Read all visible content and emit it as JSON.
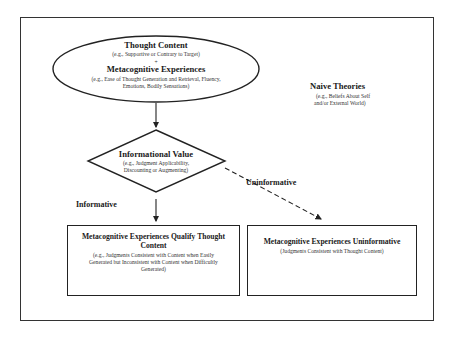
{
  "diagram": {
    "colors": {
      "stroke": "#222222",
      "background": "#ffffff",
      "text": "#1a1a1a"
    },
    "ellipse": {
      "title1": "Thought Content",
      "sub1": "(e.g., Supportive or Contrary to Target)",
      "plus": "+",
      "title2": "Metacognitive Experiences",
      "sub2_line1": "(e.g., Ease of Thought Generation and Retrieval, Fluency,",
      "sub2_line2": "Emotions, Bodily Sensations)"
    },
    "naive_theories": {
      "title": "Naive Theories",
      "sub_line1": "(e.g., Beliefs About Self",
      "sub_line2": "and/or External World)"
    },
    "diamond": {
      "title": "Informational Value",
      "sub_line1": "(e.g., Judgment Applicability,",
      "sub_line2": "Discounting or Augmenting)"
    },
    "edges": {
      "informative_label": "Informative",
      "uninformative_label": "Uninformative"
    },
    "left_box": {
      "title_line1": "Metacognitive Experiences Qualify Thought",
      "title_line2": "Content",
      "sub_line1": "(e.g., Judgments Consistent with Content when Easily",
      "sub_line2": "Generated but Inconsistent with Content when Difficultly",
      "sub_line3": "Generated)"
    },
    "right_box": {
      "title": "Metacognitive Experiences Uninformative",
      "sub": "(Judgments Consistent with Thought Content)"
    }
  }
}
